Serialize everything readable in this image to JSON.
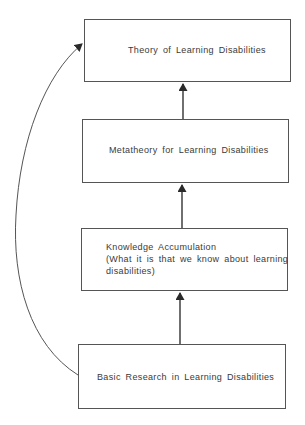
{
  "diagram": {
    "type": "hierarchical-flow",
    "direction": "bottom-to-top",
    "nodes": [
      {
        "id": "theory",
        "label": "Theory of Learning Disabilities"
      },
      {
        "id": "metatheory",
        "label": "Metatheory for Learning Disabilities"
      },
      {
        "id": "knowledge",
        "label": "Knowledge Accumulation",
        "sublabel_line1": "(What it is that we know about learning",
        "sublabel_line2": "disabilities)"
      },
      {
        "id": "basic",
        "label": "Basic Research in Learning Disabilities"
      }
    ],
    "edges": [
      {
        "from": "metatheory",
        "to": "theory",
        "style": "straight-arrow"
      },
      {
        "from": "knowledge",
        "to": "metatheory",
        "style": "straight-arrow"
      },
      {
        "from": "basic",
        "to": "knowledge",
        "style": "straight-arrow"
      },
      {
        "from": "basic",
        "to": "theory",
        "style": "curved-arrow-left"
      }
    ],
    "colors": {
      "stroke": "#555555",
      "text": "#3a3a3a",
      "background": "#ffffff"
    }
  }
}
